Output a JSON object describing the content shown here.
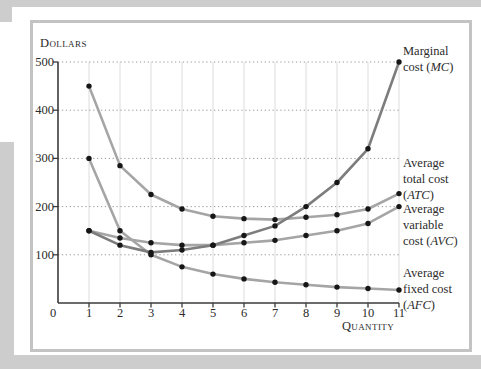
{
  "page": {
    "edge_color": "#cdcdcd",
    "frame_color": "#c3c3c3"
  },
  "chart_data": {
    "type": "line",
    "title": "",
    "ylabel": "Dollars",
    "xlabel": "Quantity",
    "x": [
      1,
      2,
      3,
      4,
      5,
      6,
      7,
      8,
      9,
      10,
      11
    ],
    "x_ticks": [
      0,
      1,
      2,
      3,
      4,
      5,
      6,
      7,
      8,
      9,
      10,
      11
    ],
    "y_ticks": [
      0,
      100,
      200,
      300,
      400,
      500
    ],
    "xlim": [
      0,
      11
    ],
    "ylim": [
      0,
      500
    ],
    "grid": true,
    "gridline_style": "dotted horizontal, light vertical",
    "legend_position": "right-edge annotations",
    "dot_color": "#161616",
    "series": [
      {
        "key": "afc",
        "name": "Average fixed cost (AFC)",
        "color": "#a5a5a5",
        "values": [
          300,
          150,
          100,
          75,
          60,
          50,
          43,
          38,
          33,
          30,
          27
        ]
      },
      {
        "key": "avc",
        "name": "Average variable cost (AVC)",
        "color": "#a5a5a5",
        "values": [
          150,
          135,
          125,
          120,
          120,
          125,
          130,
          140,
          150,
          165,
          200
        ]
      },
      {
        "key": "atc",
        "name": "Average total cost (ATC)",
        "color": "#a5a5a5",
        "values": [
          450,
          285,
          225,
          195,
          180,
          175,
          173,
          178,
          183,
          195,
          227
        ]
      },
      {
        "key": "mc",
        "name": "Marginal cost (MC)",
        "color": "#7d7d7d",
        "values": [
          150,
          120,
          105,
          110,
          120,
          140,
          160,
          200,
          250,
          320,
          500
        ]
      }
    ]
  },
  "annotations": [
    {
      "key": "mc",
      "name": "Marginal cost (MC)",
      "lines": [
        "Marginal",
        "cost (MC)"
      ]
    },
    {
      "key": "atc",
      "name": "Average total cost (ATC)",
      "lines": [
        "Average",
        "total cost",
        "(ATC)"
      ]
    },
    {
      "key": "avc",
      "name": "Average variable cost (AVC)",
      "lines": [
        "Average",
        "variable",
        "cost (AVC)"
      ]
    },
    {
      "key": "afc",
      "name": "Average fixed cost (AFC)",
      "lines": [
        "Average",
        "fixed cost",
        "(AFC)"
      ]
    }
  ]
}
